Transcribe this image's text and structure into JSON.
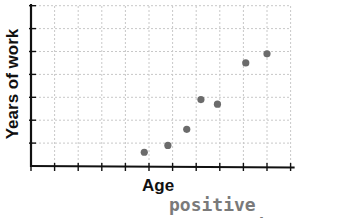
{
  "chart_data": {
    "type": "scatter",
    "title": "Experience (partially cropped)",
    "xlabel": "Age",
    "ylabel": "Years of work",
    "annotation": "positive correlation",
    "x_ticks": 11,
    "y_ticks": 7,
    "xlim": [
      0,
      11
    ],
    "ylim": [
      0,
      7
    ],
    "grid": true,
    "legend": null,
    "points": [
      {
        "x": 4.8,
        "y": 0.6
      },
      {
        "x": 5.8,
        "y": 0.9
      },
      {
        "x": 6.6,
        "y": 1.6
      },
      {
        "x": 7.2,
        "y": 2.9
      },
      {
        "x": 7.9,
        "y": 2.7
      },
      {
        "x": 9.1,
        "y": 4.5
      },
      {
        "x": 10.0,
        "y": 4.9
      }
    ],
    "colors": {
      "point": "#6b6b6b",
      "axis": "#111111",
      "grid": "#c8c8c8",
      "annotation": "#7a7a7a"
    }
  }
}
